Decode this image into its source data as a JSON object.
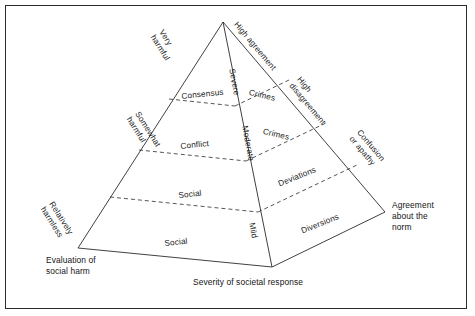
{
  "figure": {
    "line_color": "#2b2b2b",
    "text_color": "#1a1a1a",
    "background": "#ffffff"
  },
  "pyramid": {
    "apex": {
      "x": 223,
      "y": 22
    },
    "left_base": {
      "x": 78,
      "y": 248
    },
    "front_base": {
      "x": 272,
      "y": 267
    },
    "right_base": {
      "x": 385,
      "y": 212
    }
  },
  "left_face_labels": [
    {
      "text": "Consensus",
      "x": 181,
      "y": 92,
      "rotate": -6
    },
    {
      "text": "Conflict",
      "x": 180,
      "y": 142,
      "rotate": -6
    },
    {
      "text": "Social",
      "x": 178,
      "y": 191,
      "rotate": -6
    },
    {
      "text": "Social",
      "x": 164,
      "y": 239,
      "rotate": -6
    }
  ],
  "right_face_labels": [
    {
      "text": "Crimes",
      "x": 250,
      "y": 88,
      "rotate": 13
    },
    {
      "text": "Crimes",
      "x": 264,
      "y": 127,
      "rotate": 13
    },
    {
      "text": "Deviations",
      "x": 277,
      "y": 180,
      "rotate": -22
    },
    {
      "text": "Diversions",
      "x": 300,
      "y": 227,
      "rotate": -22
    }
  ],
  "left_edge_labels": [
    {
      "text": "Very\nharmful",
      "x": 165,
      "y": 28,
      "rotate": 58
    },
    {
      "text": "Somewhat\nharmful",
      "x": 141,
      "y": 110,
      "rotate": 58
    },
    {
      "text": "Relatively\nharmless",
      "x": 55,
      "y": 200,
      "rotate": 58
    }
  ],
  "center_edge_labels": [
    {
      "text": "Severe",
      "x": 236,
      "y": 68,
      "rotate": 79
    },
    {
      "text": "Moderate",
      "x": 249,
      "y": 125,
      "rotate": 79
    },
    {
      "text": "Mild",
      "x": 256,
      "y": 222,
      "rotate": 79
    }
  ],
  "right_edge_labels": [
    {
      "text": "High agreement",
      "x": 239,
      "y": 20,
      "rotate": 50
    },
    {
      "text": "High\ndisagreement",
      "x": 302,
      "y": 75,
      "rotate": 50
    },
    {
      "text": "Confusion\nor apathy",
      "x": 362,
      "y": 128,
      "rotate": 50
    }
  ],
  "axis_labels": {
    "left": {
      "text": "Evaluation of\nsocial harm",
      "x": 46,
      "y": 255
    },
    "bottom": {
      "text": "Severity of societal response",
      "x": 193,
      "y": 277
    },
    "right": {
      "text": "Agreement\nabout the\nnorm",
      "x": 392,
      "y": 200
    }
  }
}
